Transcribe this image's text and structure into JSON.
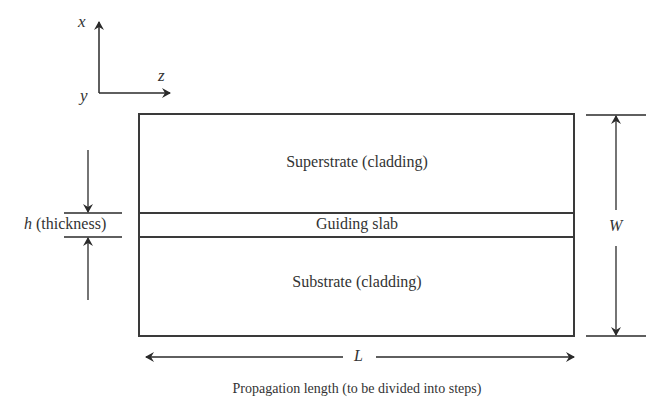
{
  "figure": {
    "axes": {
      "x_label": "x",
      "y_label": "y",
      "z_label": "z"
    },
    "regions": {
      "superstrate": "Superstrate (cladding)",
      "guiding_slab": "Guiding slab",
      "substrate": "Substrate (cladding)"
    },
    "dimensions": {
      "thickness_symbol": "h",
      "thickness_label": "(thickness)",
      "width_symbol": "W",
      "length_symbol": "L"
    },
    "caption": "Propagation length (to be divided into steps)"
  }
}
